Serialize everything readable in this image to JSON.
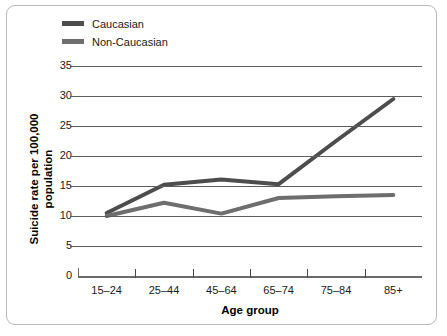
{
  "legend": {
    "position": "top-left",
    "entries": [
      {
        "label": "Caucasian",
        "color": "#4d4d4d"
      },
      {
        "label": "Non-Caucasian",
        "color": "#6e6e6e"
      }
    ]
  },
  "axes": {
    "x_title": "Age group",
    "y_title_line1": "Suicide rate per 100,000",
    "y_title_line2": "population",
    "y_ticks": [
      "35",
      "30",
      "25",
      "20",
      "15",
      "10",
      "5",
      "0"
    ],
    "x_ticks": [
      "15–24",
      "25–44",
      "45–64",
      "65–74",
      "75–84",
      "85+"
    ]
  },
  "chart_data": {
    "type": "line",
    "title": "",
    "xlabel": "Age group",
    "ylabel": "Suicide rate per 100,000 population",
    "categories": [
      "15–24",
      "25–44",
      "45–64",
      "65–74",
      "75–84",
      "85+"
    ],
    "series": [
      {
        "name": "Caucasian",
        "color": "#4d4d4d",
        "values": [
          10.5,
          15.2,
          16.1,
          15.3,
          22.5,
          29.5
        ]
      },
      {
        "name": "Non-Caucasian",
        "color": "#6e6e6e",
        "values": [
          10.0,
          12.2,
          10.4,
          13.0,
          13.3,
          13.5
        ]
      }
    ],
    "ylim": [
      0,
      35
    ],
    "ytick_step": 5,
    "grid": "horizontal",
    "legend_position": "top-left"
  }
}
